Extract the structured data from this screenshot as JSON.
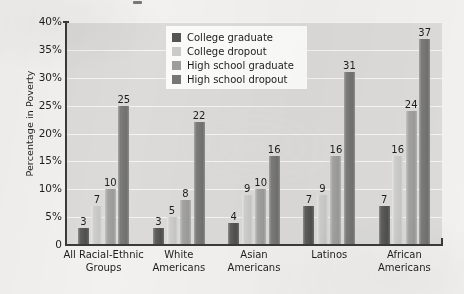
{
  "chart_data": {
    "type": "bar",
    "title": "",
    "xlabel": "",
    "ylabel": "Percentage in Poverty",
    "ylim": [
      0,
      40
    ],
    "grid": true,
    "legend_position": "top-center-inside",
    "categories": [
      "All Racial-Ethnic Groups",
      "White Americans",
      "Asian Americans",
      "Latinos",
      "African Americans"
    ],
    "category_lines": [
      [
        "All Racial-Ethnic",
        "Groups"
      ],
      [
        "White",
        "Americans"
      ],
      [
        "Asian",
        "Americans"
      ],
      [
        "Latinos",
        ""
      ],
      [
        "African",
        "Americans"
      ]
    ],
    "yticks": [
      "0",
      "5%",
      "10%",
      "15%",
      "20%",
      "25%",
      "30%",
      "35%",
      "40%"
    ],
    "ytick_values": [
      0,
      5,
      10,
      15,
      20,
      25,
      30,
      35,
      40
    ],
    "series": [
      {
        "name": "College graduate",
        "color": "#555553",
        "values": [
          3,
          3,
          4,
          7,
          7
        ]
      },
      {
        "name": "College dropout",
        "color": "#cbcbc9",
        "values": [
          7,
          5,
          9,
          9,
          16
        ]
      },
      {
        "name": "High school graduate",
        "color": "#9e9e9c",
        "values": [
          10,
          8,
          10,
          16,
          24
        ]
      },
      {
        "name": "High school dropout",
        "color": "#767674",
        "values": [
          25,
          22,
          16,
          31,
          37
        ]
      }
    ]
  },
  "legend": {
    "items": [
      {
        "label": "College graduate"
      },
      {
        "label": "College dropout"
      },
      {
        "label": "High school graduate"
      },
      {
        "label": "High school dropout"
      }
    ]
  },
  "colors": {
    "plot_background": "#dcdbd9",
    "page_background": "#f2f1ef",
    "gridline": "#f6f6f4",
    "axis": "#3a3a38",
    "text": "#1d1d1d"
  }
}
